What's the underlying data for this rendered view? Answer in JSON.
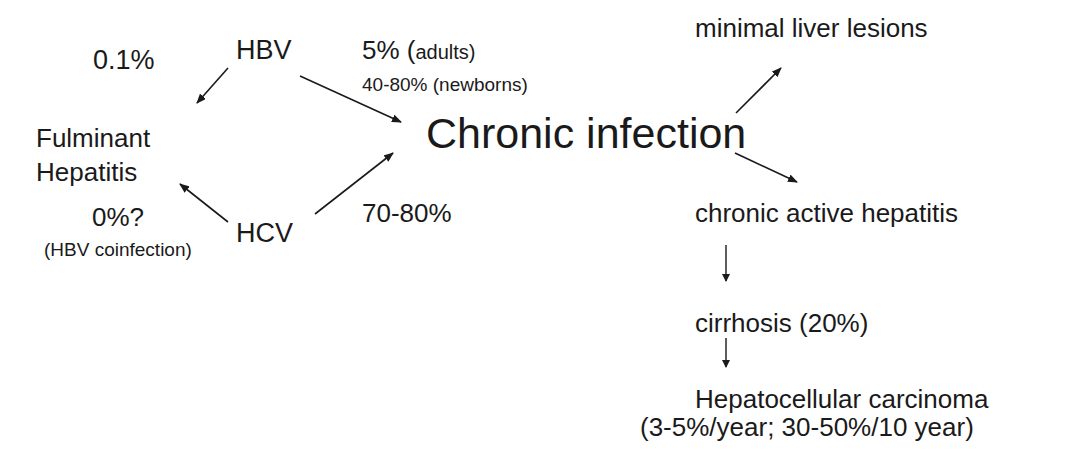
{
  "diagram": {
    "type": "flow",
    "nodes": {
      "hbv": "HBV",
      "hcv": "HCV",
      "fulminant_line1": "Fulminant",
      "fulminant_line2": "Hepatitis",
      "chronic_infection": "Chronic infection",
      "minimal_lesions": "minimal liver lesions",
      "chronic_active": "chronic active hepatitis",
      "cirrhosis": "cirrhosis (20%)",
      "hcc": "Hepatocellular carcinoma",
      "hcc_rate": "(3-5%/year; 30-50%/10 year)"
    },
    "edge_labels": {
      "hbv_to_fulminant": "0.1%",
      "hcv_to_fulminant": "0%?",
      "hcv_to_fulminant_note": "(HBV coinfection)",
      "hbv_to_chronic_main": "5% (",
      "hbv_to_chronic_adults": "adults)",
      "hbv_to_chronic_newborns": "40-80% (newborns)",
      "hcv_to_chronic": "70-80%"
    },
    "edges": [
      {
        "from": "HBV",
        "to": "Fulminant Hepatitis",
        "label": "0.1%"
      },
      {
        "from": "HBV",
        "to": "Chronic infection",
        "label": "5% (adults); 40-80% (newborns)"
      },
      {
        "from": "HCV",
        "to": "Fulminant Hepatitis",
        "label": "0%? (HBV coinfection)"
      },
      {
        "from": "HCV",
        "to": "Chronic infection",
        "label": "70-80%"
      },
      {
        "from": "Chronic infection",
        "to": "minimal liver lesions",
        "label": ""
      },
      {
        "from": "Chronic infection",
        "to": "chronic active hepatitis",
        "label": ""
      },
      {
        "from": "chronic active hepatitis",
        "to": "cirrhosis (20%)",
        "label": ""
      },
      {
        "from": "cirrhosis (20%)",
        "to": "Hepatocellular carcinoma",
        "label": ""
      }
    ],
    "colors": {
      "text": "#1a1a1a",
      "arrow": "#1a1a1a",
      "background": "#ffffff"
    }
  }
}
